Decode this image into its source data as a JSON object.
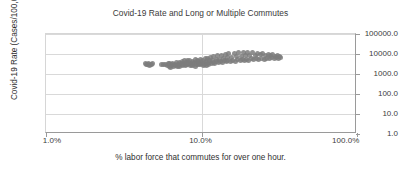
{
  "chart_data": {
    "type": "scatter",
    "title": "Covid-19 Rate and Long or Multiple Commutes",
    "xlabel": "% labor force that commutes for over one hour.",
    "ylabel": "Covid-19 Rate (Cases/100,000)",
    "xscale": "log",
    "yscale": "log",
    "xlim": [
      1.0,
      100.0
    ],
    "ylim": [
      1.0,
      100000.0
    ],
    "xticks": [
      1.0,
      10.0,
      100.0
    ],
    "xtick_labels": [
      "1.0%",
      "10.0%",
      "100.0%"
    ],
    "yticks": [
      1.0,
      10.0,
      100.0,
      1000.0,
      10000.0,
      100000.0
    ],
    "ytick_labels": [
      "1.0",
      "10.0",
      "100.0",
      "1000.0",
      "10000.0",
      "100000.0"
    ],
    "ytick_label_position": "right",
    "grid": "horizontal-and-vertical",
    "legend": "none",
    "marker_color": "#7d7d7d",
    "marker_size_px": 5,
    "series": [
      {
        "name": "counties",
        "points": [
          [
            4.35,
            3200
          ],
          [
            4.42,
            3050
          ],
          [
            4.5,
            2850
          ],
          [
            4.58,
            3400
          ],
          [
            4.62,
            2700
          ],
          [
            4.7,
            3150
          ],
          [
            4.78,
            2950
          ],
          [
            4.85,
            3300
          ],
          [
            5.55,
            2900
          ],
          [
            5.7,
            3000
          ],
          [
            5.85,
            3100
          ],
          [
            6.0,
            2600
          ],
          [
            6.1,
            3250
          ],
          [
            6.2,
            2500
          ],
          [
            6.25,
            3500
          ],
          [
            6.3,
            2200
          ],
          [
            6.4,
            3000
          ],
          [
            6.45,
            2700
          ],
          [
            6.55,
            3350
          ],
          [
            6.6,
            2400
          ],
          [
            6.7,
            3150
          ],
          [
            6.8,
            2800
          ],
          [
            6.9,
            3600
          ],
          [
            7.0,
            2300
          ],
          [
            7.05,
            3050
          ],
          [
            7.1,
            2650
          ],
          [
            7.2,
            3900
          ],
          [
            7.25,
            2450
          ],
          [
            7.35,
            3250
          ],
          [
            7.4,
            2900
          ],
          [
            7.5,
            4200
          ],
          [
            7.55,
            2550
          ],
          [
            7.6,
            3400
          ],
          [
            7.7,
            3000
          ],
          [
            7.8,
            4500
          ],
          [
            7.85,
            2700
          ],
          [
            7.95,
            3600
          ],
          [
            8.0,
            3100
          ],
          [
            8.1,
            4800
          ],
          [
            8.15,
            2850
          ],
          [
            8.25,
            3750
          ],
          [
            8.3,
            3200
          ],
          [
            8.4,
            5000
          ],
          [
            8.45,
            2600
          ],
          [
            8.55,
            3500
          ],
          [
            8.6,
            3050
          ],
          [
            8.7,
            4300
          ],
          [
            8.8,
            2750
          ],
          [
            8.9,
            3850
          ],
          [
            9.0,
            3300
          ],
          [
            9.1,
            5200
          ],
          [
            9.15,
            2400
          ],
          [
            9.25,
            3650
          ],
          [
            9.3,
            3000
          ],
          [
            9.4,
            4600
          ],
          [
            9.5,
            2850
          ],
          [
            9.6,
            4100
          ],
          [
            9.7,
            3400
          ],
          [
            9.8,
            5500
          ],
          [
            9.9,
            2950
          ],
          [
            10.0,
            3800
          ],
          [
            10.1,
            3250
          ],
          [
            10.2,
            4900
          ],
          [
            10.3,
            2600
          ],
          [
            10.4,
            3550
          ],
          [
            10.5,
            3100
          ],
          [
            10.6,
            5800
          ],
          [
            10.7,
            2800
          ],
          [
            10.8,
            4200
          ],
          [
            10.9,
            3450
          ],
          [
            11.0,
            6200
          ],
          [
            11.1,
            3000
          ],
          [
            11.2,
            4500
          ],
          [
            11.3,
            3700
          ],
          [
            11.5,
            6800
          ],
          [
            11.6,
            3200
          ],
          [
            11.8,
            4900
          ],
          [
            11.9,
            3900
          ],
          [
            12.0,
            7500
          ],
          [
            12.2,
            3400
          ],
          [
            12.4,
            5200
          ],
          [
            12.5,
            4100
          ],
          [
            12.7,
            8200
          ],
          [
            12.9,
            3600
          ],
          [
            13.0,
            5600
          ],
          [
            13.2,
            4300
          ],
          [
            13.4,
            8800
          ],
          [
            13.6,
            3800
          ],
          [
            13.8,
            6000
          ],
          [
            14.0,
            4500
          ],
          [
            14.2,
            9500
          ],
          [
            14.4,
            4000
          ],
          [
            14.6,
            6400
          ],
          [
            14.8,
            4700
          ],
          [
            15.0,
            10200
          ],
          [
            15.3,
            4200
          ],
          [
            15.6,
            6800
          ],
          [
            15.9,
            4900
          ],
          [
            16.2,
            10800
          ],
          [
            16.5,
            4400
          ],
          [
            16.8,
            7200
          ],
          [
            17.1,
            5100
          ],
          [
            17.4,
            11500
          ],
          [
            17.7,
            4600
          ],
          [
            18.0,
            7600
          ],
          [
            18.3,
            5300
          ],
          [
            18.6,
            12000
          ],
          [
            18.9,
            4800
          ],
          [
            19.2,
            8000
          ],
          [
            19.5,
            5500
          ],
          [
            19.8,
            12500
          ],
          [
            20.1,
            5000
          ],
          [
            20.5,
            8400
          ],
          [
            20.9,
            5700
          ],
          [
            21.3,
            11800
          ],
          [
            21.7,
            5200
          ],
          [
            22.1,
            8800
          ],
          [
            22.5,
            5900
          ],
          [
            22.9,
            11000
          ],
          [
            23.3,
            5400
          ],
          [
            23.8,
            9000
          ],
          [
            24.3,
            6100
          ],
          [
            24.8,
            10500
          ],
          [
            25.3,
            5600
          ],
          [
            25.8,
            8600
          ],
          [
            26.3,
            6300
          ],
          [
            26.8,
            9800
          ],
          [
            27.3,
            5800
          ],
          [
            27.8,
            8200
          ],
          [
            28.3,
            6500
          ],
          [
            28.8,
            9200
          ],
          [
            29.3,
            6000
          ],
          [
            29.8,
            7800
          ],
          [
            30.3,
            6700
          ],
          [
            30.8,
            8600
          ],
          [
            31.3,
            6200
          ],
          [
            31.8,
            7400
          ],
          [
            32.3,
            6900
          ]
        ]
      }
    ]
  }
}
